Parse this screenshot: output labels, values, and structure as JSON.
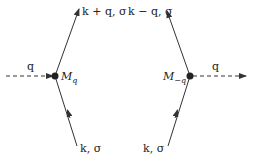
{
  "diagram": {
    "left_vertex": {
      "label": "M",
      "subscript": "q",
      "incoming_boson_label": "q",
      "outgoing_fermion_label": "k + q, σ",
      "incoming_fermion_label": "k, σ"
    },
    "right_vertex": {
      "label": "M",
      "subscript": "−q",
      "outgoing_boson_label": "q",
      "outgoing_fermion_label": "k − q, σ",
      "incoming_fermion_label": "k, σ"
    },
    "colors": {
      "line": "#333333",
      "background": "#ffffff"
    }
  }
}
